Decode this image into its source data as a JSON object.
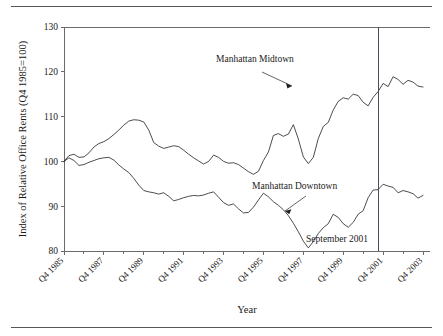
{
  "chart_data": {
    "type": "line",
    "title": "",
    "xlabel": "Year",
    "ylabel": "Index of Relative Office Rents (Q4 1985=100)",
    "ylim": [
      80,
      130
    ],
    "yticks": [
      80,
      90,
      100,
      110,
      120,
      130
    ],
    "grid": false,
    "legend_position": "inline-annotations",
    "x_start_label": "Q4 1985",
    "x_end_label": "Q4 2003",
    "categories": [
      "Q4 1985",
      "Q1 1986",
      "Q2 1986",
      "Q3 1986",
      "Q4 1986",
      "Q1 1987",
      "Q2 1987",
      "Q3 1987",
      "Q4 1987",
      "Q1 1988",
      "Q2 1988",
      "Q3 1988",
      "Q4 1988",
      "Q1 1989",
      "Q2 1989",
      "Q3 1989",
      "Q4 1989",
      "Q1 1990",
      "Q2 1990",
      "Q3 1990",
      "Q4 1990",
      "Q1 1991",
      "Q2 1991",
      "Q3 1991",
      "Q4 1991",
      "Q1 1992",
      "Q2 1992",
      "Q3 1992",
      "Q4 1992",
      "Q1 1993",
      "Q2 1993",
      "Q3 1993",
      "Q4 1993",
      "Q1 1994",
      "Q2 1994",
      "Q3 1994",
      "Q4 1994",
      "Q1 1995",
      "Q2 1995",
      "Q3 1995",
      "Q4 1995",
      "Q1 1996",
      "Q2 1996",
      "Q3 1996",
      "Q4 1996",
      "Q1 1997",
      "Q2 1997",
      "Q3 1997",
      "Q4 1997",
      "Q1 1998",
      "Q2 1998",
      "Q3 1998",
      "Q4 1998",
      "Q1 1999",
      "Q2 1999",
      "Q3 1999",
      "Q4 1999",
      "Q1 2000",
      "Q2 2000",
      "Q3 2000",
      "Q4 2000",
      "Q1 2001",
      "Q2 2001",
      "Q3 2001",
      "Q4 2001",
      "Q1 2002",
      "Q2 2002",
      "Q3 2002",
      "Q4 2002",
      "Q1 2003",
      "Q2 2003",
      "Q3 2003",
      "Q4 2003"
    ],
    "xticks": [
      "Q4 1985",
      "Q4 1987",
      "Q4 1989",
      "Q4 1991",
      "Q4 1993",
      "Q4 1995",
      "Q4 1997",
      "Q4 1999",
      "Q4 2001",
      "Q4 2003"
    ],
    "series": [
      {
        "name": "Manhattan Midtown",
        "values": [
          100.0,
          101.3,
          101.6,
          100.9,
          101.0,
          101.9,
          103.2,
          104.0,
          104.4,
          105.1,
          106.0,
          107.0,
          108.1,
          109.0,
          109.3,
          109.2,
          108.8,
          107.0,
          104.2,
          103.4,
          102.9,
          103.2,
          103.5,
          103.3,
          102.5,
          101.6,
          100.8,
          100.1,
          99.4,
          100.0,
          101.4,
          100.9,
          100.0,
          99.6,
          99.7,
          99.3,
          98.5,
          97.7,
          97.1,
          97.8,
          100.2,
          102.1,
          105.8,
          106.2,
          105.6,
          106.1,
          108.2,
          105.0,
          101.0,
          99.5,
          100.9,
          105.1,
          107.8,
          108.7,
          111.5,
          113.4,
          114.2,
          113.9,
          115.0,
          114.7,
          113.2,
          112.4,
          114.3,
          115.6,
          117.4,
          116.7,
          118.9,
          118.3,
          117.2,
          118.1,
          117.7,
          116.8,
          116.6
        ]
      },
      {
        "name": "Manhattan Downtown",
        "values": [
          100.0,
          100.8,
          100.2,
          99.1,
          99.3,
          99.8,
          100.2,
          100.6,
          100.8,
          100.9,
          100.3,
          99.2,
          98.3,
          97.5,
          96.2,
          94.7,
          93.5,
          93.2,
          93.0,
          92.7,
          93.0,
          92.2,
          91.2,
          91.5,
          91.9,
          92.2,
          92.4,
          92.3,
          92.5,
          92.9,
          93.2,
          92.0,
          90.8,
          90.2,
          90.5,
          89.4,
          88.5,
          88.6,
          89.8,
          91.4,
          92.9,
          92.1,
          91.0,
          90.2,
          89.2,
          87.9,
          86.2,
          84.3,
          82.2,
          80.7,
          82.1,
          83.9,
          85.2,
          86.1,
          88.2,
          87.5,
          86.1,
          85.3,
          86.4,
          88.2,
          89.0,
          91.9,
          93.6,
          93.7,
          94.9,
          94.5,
          94.2,
          93.0,
          93.5,
          93.2,
          92.8,
          91.8,
          92.4
        ]
      }
    ],
    "annotations": [
      {
        "name": "midtown-label",
        "text": "Manhattan Midtown",
        "target_series": "Manhattan Midtown"
      },
      {
        "name": "downtown-label",
        "text": "Manhattan Downtown",
        "target_series": "Manhattan Downtown"
      },
      {
        "name": "event-marker-label",
        "text": "September 2001",
        "event_quarter": "Q3 2001"
      }
    ]
  },
  "axis": {
    "y_title": "Index of Relative Office Rents (Q4 1985=100)",
    "x_title": "Year",
    "y_labels": [
      "130",
      "120",
      "110",
      "100",
      "90",
      "80"
    ],
    "x_labels": [
      "Q4 1985",
      "Q4 1987",
      "Q4 1989",
      "Q4 1991",
      "Q4 1993",
      "Q4 1995",
      "Q4 1997",
      "Q4 1999",
      "Q4 2001",
      "Q4 2003"
    ]
  },
  "annotations": {
    "midtown": "Manhattan Midtown",
    "downtown": "Manhattan Downtown",
    "september": "September 2001"
  },
  "colors": {
    "line": "#1f1f1f",
    "axis": "#6b6b6b",
    "event": "#4a4a58",
    "rule": "#555555",
    "background": "#ffffff"
  }
}
